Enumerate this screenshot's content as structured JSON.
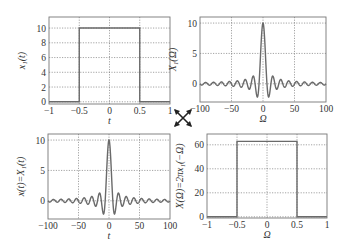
{
  "figure": {
    "center_symbol": "duality-arrows-icon"
  },
  "chart_data": [
    {
      "id": "top-left",
      "type": "line",
      "title": "",
      "xlabel": "t",
      "ylabel": "x1(t)",
      "xlim": [
        -1,
        1
      ],
      "ylim": [
        -0.3,
        11.5
      ],
      "xticks": [
        "-1",
        "-0.5",
        "0",
        "0.5",
        "1"
      ],
      "yticks": [
        "0",
        "2",
        "4",
        "6",
        "8",
        "10"
      ],
      "grid": true,
      "description": "Rectangular pulse of height 10 for |t| < 0.5, zero elsewhere",
      "x": [
        -1,
        -0.5,
        -0.5,
        0.5,
        0.5,
        1
      ],
      "y": [
        0,
        0,
        10,
        10,
        0,
        0
      ]
    },
    {
      "id": "top-right",
      "type": "line",
      "title": "",
      "xlabel": "Ω",
      "ylabel": "X1(Ω)",
      "xlim": [
        -100,
        100
      ],
      "ylim": [
        -3,
        11
      ],
      "xticks": [
        "-100",
        "-50",
        "0",
        "50",
        "100"
      ],
      "yticks": [
        "0",
        "5",
        "10"
      ],
      "grid": true,
      "description": "Sinc spectrum X1(Ω)=20 sin(Ω/2)/Ω, peak 10 at Ω=0",
      "function": "20*sin(w/2)/w"
    },
    {
      "id": "bottom-left",
      "type": "line",
      "title": "",
      "xlabel": "t",
      "ylabel": "x(t)=X1(t)",
      "xlim": [
        -100,
        100
      ],
      "ylim": [
        -3,
        11
      ],
      "xticks": [
        "-100",
        "-50",
        "0",
        "50",
        "100"
      ],
      "yticks": [
        "0",
        "5",
        "10"
      ],
      "grid": true,
      "description": "Sinc signal x(t)=20 sin(t/2)/t, peak 10 at t=0",
      "function": "20*sin(t/2)/t"
    },
    {
      "id": "bottom-right",
      "type": "line",
      "title": "",
      "xlabel": "Ω",
      "ylabel": "X(Ω)=2πx1(−Ω)",
      "xlim": [
        -1,
        1
      ],
      "ylim": [
        -1,
        69
      ],
      "xticks": [
        "-1",
        "-0.5",
        "0",
        "0.5",
        "1"
      ],
      "yticks": [
        "0",
        "20",
        "40",
        "60"
      ],
      "grid": true,
      "description": "Rectangular spectrum of height 20π≈62.8 for |Ω| < 0.5",
      "x": [
        -1,
        -0.5,
        -0.5,
        0.5,
        0.5,
        1
      ],
      "y": [
        0,
        0,
        62.83,
        62.83,
        0,
        0
      ]
    }
  ],
  "labels": {
    "tl_x": "t",
    "tl_y": "x₁(t)",
    "tr_x": "Ω",
    "tr_y": "X₁(Ω)",
    "bl_x": "t",
    "bl_y": "x(t)=X₁(t)",
    "br_x": "Ω",
    "br_y": "X(Ω)=2πx₁(−Ω)"
  }
}
